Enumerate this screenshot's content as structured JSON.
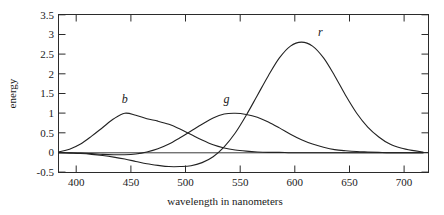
{
  "chart_data": {
    "type": "line",
    "title": "",
    "xlabel": "wavelength in nanometers",
    "ylabel": "energy",
    "xlim": [
      385,
      720
    ],
    "ylim": [
      -0.5,
      3.5
    ],
    "grid": false,
    "legend": "inline-curve-labels",
    "xticks": [
      400,
      450,
      500,
      550,
      600,
      650,
      700
    ],
    "xtick_labels": [
      "400",
      "450",
      "500",
      "550",
      "600",
      "650",
      "700"
    ],
    "yticks": [
      -0.5,
      0,
      0.5,
      1,
      1.5,
      2,
      2.5,
      3,
      3.5
    ],
    "ytick_labels": [
      "-0.5",
      "0",
      "0.5",
      "1",
      "1.5",
      "2",
      "2.5",
      "3",
      "3.5"
    ],
    "annotations": [
      {
        "text": "b",
        "x": 445,
        "y": 1.25
      },
      {
        "text": "g",
        "x": 537,
        "y": 1.25
      },
      {
        "text": "r",
        "x": 622,
        "y": 2.95
      }
    ],
    "x": [
      385,
      395,
      405,
      415,
      425,
      435,
      445,
      455,
      465,
      475,
      485,
      495,
      505,
      515,
      525,
      535,
      545,
      555,
      565,
      575,
      585,
      595,
      605,
      615,
      625,
      635,
      645,
      655,
      665,
      675,
      685,
      695,
      705,
      715
    ],
    "series": [
      {
        "name": "b",
        "label": "b",
        "peak_x": 445,
        "peak_y": 1.0,
        "values": [
          0.02,
          0.09,
          0.22,
          0.42,
          0.64,
          0.86,
          1.0,
          0.95,
          0.86,
          0.8,
          0.72,
          0.6,
          0.46,
          0.32,
          0.2,
          0.12,
          0.07,
          0.04,
          0.02,
          0.01,
          0.01,
          0.0,
          0.0,
          0.0,
          0.0,
          0.0,
          0.0,
          0.0,
          0.0,
          0.0,
          0.0,
          0.0,
          0.0,
          0.0
        ]
      },
      {
        "name": "g",
        "label": "g",
        "peak_x": 540,
        "peak_y": 1.0,
        "values": [
          0.0,
          0.0,
          -0.01,
          -0.02,
          -0.04,
          -0.05,
          -0.05,
          -0.03,
          0.02,
          0.1,
          0.22,
          0.38,
          0.55,
          0.72,
          0.88,
          0.98,
          1.0,
          0.97,
          0.9,
          0.78,
          0.63,
          0.47,
          0.33,
          0.22,
          0.14,
          0.08,
          0.05,
          0.03,
          0.02,
          0.01,
          0.0,
          0.0,
          0.0,
          0.0
        ]
      },
      {
        "name": "r",
        "label": "r",
        "peak_x": 605,
        "peak_y": 2.8,
        "dip_x": 510,
        "dip_y": -0.35,
        "values": [
          0.0,
          -0.01,
          -0.02,
          -0.04,
          -0.07,
          -0.11,
          -0.16,
          -0.22,
          -0.28,
          -0.32,
          -0.35,
          -0.35,
          -0.33,
          -0.25,
          -0.1,
          0.15,
          0.5,
          0.95,
          1.45,
          1.95,
          2.4,
          2.7,
          2.8,
          2.7,
          2.4,
          1.95,
          1.45,
          1.0,
          0.65,
          0.4,
          0.22,
          0.12,
          0.06,
          0.02
        ]
      }
    ]
  },
  "axes": {
    "y_title": "energy",
    "x_title": "wavelength in nanometers"
  }
}
